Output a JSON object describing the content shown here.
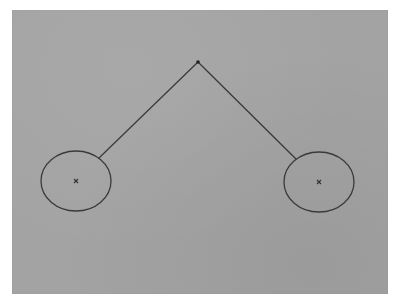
{
  "diagram": {
    "background_color": "#a3a3a3",
    "stroke_color": "#3a3a3a",
    "apex": {
      "x": 198,
      "y": 62,
      "label": ""
    },
    "left_node": {
      "center": {
        "x": 76,
        "y": 181
      },
      "rx": 35,
      "ry": 30,
      "marker": "×",
      "line_end": {
        "x": 99,
        "y": 158
      }
    },
    "right_node": {
      "center": {
        "x": 319,
        "y": 182
      },
      "rx": 35,
      "ry": 30,
      "marker": "×",
      "line_end": {
        "x": 296,
        "y": 159
      }
    }
  }
}
